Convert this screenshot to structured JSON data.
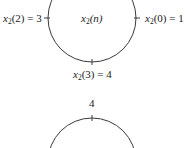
{
  "diagram": {
    "type": "circular-sequence",
    "circle1": {
      "center_label": {
        "var": "x",
        "sub": "2",
        "arg": "(n)"
      },
      "labels": {
        "right": {
          "var": "x",
          "sub": "2",
          "arg": "(0) = 1"
        },
        "left": {
          "var": "x",
          "sub": "2",
          "arg": "(2) = 3"
        },
        "bottom": {
          "var": "x",
          "sub": "2",
          "arg": "(3) = 4"
        }
      }
    },
    "circle2": {
      "labels": {
        "top": "4"
      }
    }
  }
}
